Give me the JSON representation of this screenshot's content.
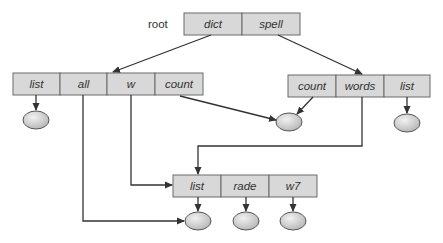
{
  "diagram": {
    "type": "directory-structure",
    "root_label": "root",
    "colors": {
      "box_fill": "#d8d8d8",
      "box_stroke": "#6a6a6a",
      "line": "#333333",
      "node_fill": "#cfcfcf",
      "node_stroke": "#555555"
    },
    "root_dir": {
      "entries": [
        "dict",
        "spell"
      ]
    },
    "dict_dir": {
      "entries": [
        "list",
        "all",
        "w",
        "count"
      ]
    },
    "spell_dir": {
      "entries": [
        "count",
        "words",
        "list"
      ]
    },
    "shared_dir": {
      "entries": [
        "list",
        "rade",
        "w7"
      ]
    },
    "edges": [
      {
        "from": "root.dict",
        "to": "dict_dir"
      },
      {
        "from": "root.spell",
        "to": "spell_dir"
      },
      {
        "from": "dict_dir.list",
        "to": "file_1"
      },
      {
        "from": "dict_dir.all",
        "to": "file_shared_list"
      },
      {
        "from": "dict_dir.w",
        "to": "shared_dir"
      },
      {
        "from": "dict_dir.count",
        "to": "file_count"
      },
      {
        "from": "spell_dir.count",
        "to": "file_count"
      },
      {
        "from": "spell_dir.words",
        "to": "shared_dir"
      },
      {
        "from": "spell_dir.list",
        "to": "file_2"
      },
      {
        "from": "shared_dir.list",
        "to": "file_shared_list"
      },
      {
        "from": "shared_dir.rade",
        "to": "file_rade"
      },
      {
        "from": "shared_dir.w7",
        "to": "file_w7"
      }
    ]
  }
}
